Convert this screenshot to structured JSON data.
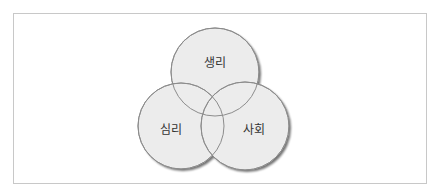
{
  "diagram": {
    "type": "venn",
    "colors": {
      "frame_border": "#c8c8c8",
      "circle_fill": "#ececec",
      "circle_stroke": "#8c8c8c",
      "shadow": "#6e6e6e",
      "text": "#333333"
    },
    "circles": [
      {
        "id": "biological",
        "label": "생리",
        "cx": 215,
        "cy": 72,
        "r": 44
      },
      {
        "id": "psychological",
        "label": "심리",
        "cx": 181,
        "cy": 126,
        "r": 43
      },
      {
        "id": "social",
        "label": "사회",
        "cx": 245,
        "cy": 126,
        "r": 44
      }
    ]
  }
}
